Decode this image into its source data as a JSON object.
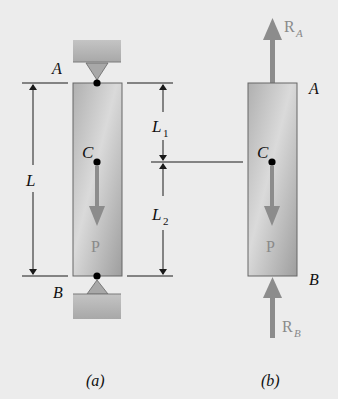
{
  "figure": {
    "panel_a": {
      "caption": "(a)",
      "support_top_label": "A",
      "support_bottom_label": "B",
      "centroid_label": "C",
      "load_label": "P",
      "dimension_total": "L",
      "dimension_upper": "L",
      "dimension_upper_sub": "1",
      "dimension_lower": "L",
      "dimension_lower_sub": "2"
    },
    "panel_b": {
      "caption": "(b)",
      "top_label": "A",
      "bottom_label": "B",
      "centroid_label": "C",
      "load_label": "P",
      "reaction_top": "R",
      "reaction_top_sub": "A",
      "reaction_bottom": "R",
      "reaction_bottom_sub": "B"
    },
    "colors": {
      "background": "#ececec",
      "bar_fill_light": "#d2d2d2",
      "bar_fill_dark": "#9a9a9a",
      "force_arrow": "#8c8c8c",
      "line": "#1a1a1a"
    }
  }
}
